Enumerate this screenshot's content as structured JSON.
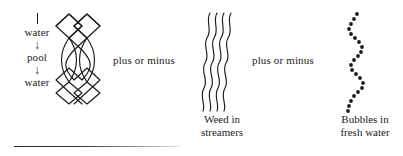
{
  "figure": {
    "legend": {
      "tick_icon": "vertical-tick",
      "items": [
        {
          "type": "label",
          "text": "water"
        },
        {
          "type": "arrow",
          "text": "↓"
        },
        {
          "type": "label",
          "text": "pool"
        },
        {
          "type": "arrow",
          "text": "↓"
        },
        {
          "type": "label",
          "text": "water"
        }
      ]
    },
    "motifs": [
      {
        "id": "braid",
        "icon": "braided-lattice-icon",
        "description": "braided lattice of crossing strands: diamond lattice top, elongated lens curves middle, diamond lattice bottom",
        "caption": ""
      },
      {
        "id": "weed",
        "icon": "wavy-streamers-icon",
        "description": "four parallel vertical wavy lines",
        "caption": "Weed in\nstreamers",
        "caption_lines": [
          "Weed in",
          "streamers"
        ]
      },
      {
        "id": "bubbles",
        "icon": "dotted-wave-icon",
        "description": "vertical serpentine chain of round dots",
        "caption": "Bubbles in\nfresh water",
        "caption_lines": [
          "Bubbles in",
          "fresh water"
        ]
      }
    ],
    "connectors": [
      {
        "id": "connector-1",
        "text": "plus or minus"
      },
      {
        "id": "connector-2",
        "text": "plus or minus"
      }
    ],
    "rule": {
      "present": true
    },
    "colors": {
      "ink": "#1b1b1b",
      "background": "#ffffff",
      "rule": "#2b2b2b"
    }
  }
}
